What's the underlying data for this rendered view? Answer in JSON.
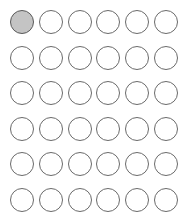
{
  "grid": {
    "rows": 6,
    "cols": 6,
    "selected": [
      [
        0,
        0
      ]
    ],
    "colors": {
      "border": "#6a6a6a",
      "fill": "#ffffff",
      "selected_fill": "#c4c4c4"
    }
  }
}
